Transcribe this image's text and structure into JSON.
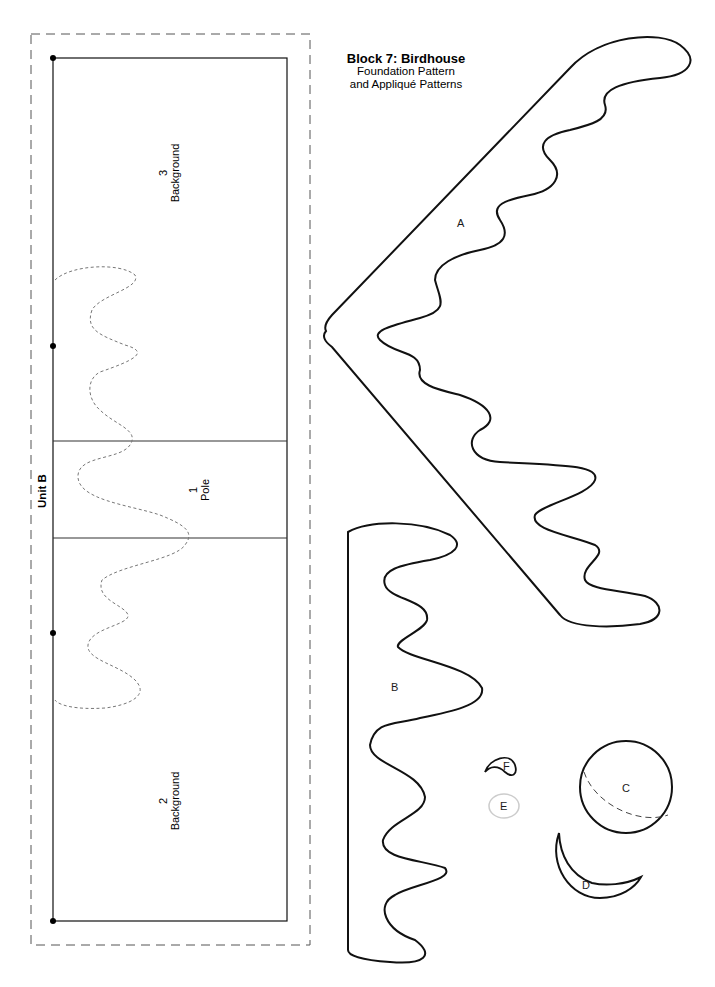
{
  "title": {
    "main": "Block 7: Birdhouse",
    "line2": "Foundation Pattern",
    "line3": "and Appliqué Patterns"
  },
  "foundation": {
    "unit_label": "Unit B",
    "sections": [
      {
        "number": "3",
        "name": "Background"
      },
      {
        "number": "1",
        "name": "Pole"
      },
      {
        "number": "2",
        "name": "Background"
      }
    ]
  },
  "applique": {
    "pieces": [
      {
        "id": "A"
      },
      {
        "id": "B"
      },
      {
        "id": "C"
      },
      {
        "id": "D"
      },
      {
        "id": "E"
      },
      {
        "id": "F"
      }
    ]
  },
  "colors": {
    "line": "#111111",
    "dashed_guide": "#777777",
    "outline_E": "#cccccc"
  }
}
